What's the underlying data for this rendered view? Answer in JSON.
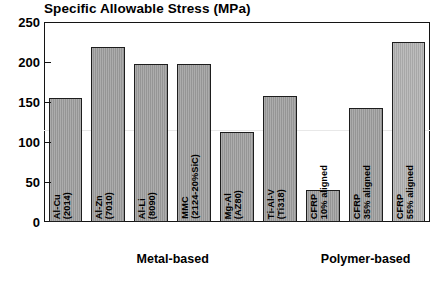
{
  "chart_data": {
    "type": "bar",
    "title": "Specific Allowable Stress (MPa)",
    "xlabel": "",
    "ylabel": "",
    "ylim": [
      0,
      250
    ],
    "yticks": [
      0,
      50,
      100,
      150,
      200,
      250
    ],
    "grid": false,
    "legend": null,
    "categories": [
      "Al-Cu\n(2014)",
      "Al-Zn\n(7010)",
      "Al-Li\n(8090)",
      "MMC\n(2124-20%SiC)",
      "Mg-Al\n(AZ80)",
      "Ti-Al-V\n(Ti318)",
      "CFRP\n10% aligned",
      "CFRP\n35% aligned",
      "CFRP\n55% aligned"
    ],
    "values": [
      155,
      219,
      198,
      198,
      112,
      158,
      40,
      143,
      225
    ],
    "groups": [
      {
        "label": "Metal-based",
        "categories": 6
      },
      {
        "label": "Polymer-based",
        "categories": 3
      }
    ]
  },
  "axis": {
    "tick_labels": [
      "250",
      "200",
      "150",
      "100",
      "50",
      "0"
    ]
  },
  "bars": [
    {
      "label_line1": "Al-Cu",
      "label_line2": "(2014)",
      "value": 155
    },
    {
      "label_line1": "Al-Zn",
      "label_line2": "(7010)",
      "value": 219
    },
    {
      "label_line1": "Al-Li",
      "label_line2": "(8090)",
      "value": 198
    },
    {
      "label_line1": "MMC",
      "label_line2": "(2124-20%SiC)",
      "value": 198
    },
    {
      "label_line1": "Mg-Al",
      "label_line2": "(AZ80)",
      "value": 112
    },
    {
      "label_line1": "Ti-Al-V",
      "label_line2": "(Ti318)",
      "value": 158
    },
    {
      "label_line1": "CFRP",
      "label_line2": "10% aligned",
      "value": 40
    },
    {
      "label_line1": "CFRP",
      "label_line2": "35% aligned",
      "value": 143
    },
    {
      "label_line1": "CFRP",
      "label_line2": "55% aligned",
      "value": 225
    }
  ],
  "groups": {
    "metal": "Metal-based",
    "polymer": "Polymer-based"
  },
  "colors": {
    "bar_fill": "#9d9d9d",
    "bar_fill_light": "#b0b0b0",
    "bar_stroke": "#1d1d1d",
    "axis": "#141414",
    "text": "#000000",
    "background": "#ffffff"
  }
}
